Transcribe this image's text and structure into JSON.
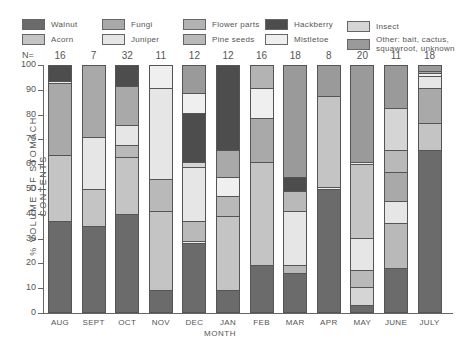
{
  "chart_data": {
    "type": "bar",
    "stacked": true,
    "title": "",
    "xlabel": "MONTH",
    "ylabel": "% VOLUME OF STOMACH CONTENTS",
    "ylim": [
      0,
      100
    ],
    "yticks": [
      0,
      10,
      20,
      30,
      40,
      50,
      60,
      70,
      80,
      90,
      100
    ],
    "grid": false,
    "legend_position": "top",
    "n_label": "N=",
    "categories": [
      "AUG",
      "SEPT",
      "OCT",
      "NOV",
      "DEC",
      "JAN",
      "FEB",
      "MAR",
      "APR",
      "MAY",
      "JUNE",
      "JULY"
    ],
    "n_values": [
      16,
      7,
      32,
      11,
      12,
      12,
      16,
      18,
      8,
      20,
      11,
      18
    ],
    "legend": [
      {
        "name": "Walnut",
        "color": "#6b6b6b"
      },
      {
        "name": "Acorn",
        "color": "#c4c4c4"
      },
      {
        "name": "Fungi",
        "color": "#a9a9a9"
      },
      {
        "name": "Juniper",
        "color": "#e6e6e6"
      },
      {
        "name": "Flower parts",
        "color": "#b3b3b3"
      },
      {
        "name": "Pine seeds",
        "color": "#b9b9b9"
      },
      {
        "name": "Hackberry",
        "color": "#4d4d4d"
      },
      {
        "name": "Mistletoe",
        "color": "#efefef"
      },
      {
        "name": "Insect",
        "color": "#d5d5d5"
      },
      {
        "name": "Other: bait, cactus, squawroot, unknown",
        "color": "#9a9a9a"
      }
    ],
    "bars": [
      {
        "month": "AUG",
        "segments": [
          {
            "cat": "Walnut",
            "value": 37
          },
          {
            "cat": "Acorn",
            "value": 27
          },
          {
            "cat": "Fungi",
            "value": 29
          },
          {
            "cat": "Mistletoe",
            "value": 1
          },
          {
            "cat": "Hackberry",
            "value": 6
          }
        ]
      },
      {
        "month": "SEPT",
        "segments": [
          {
            "cat": "Walnut",
            "value": 35
          },
          {
            "cat": "Acorn",
            "value": 15
          },
          {
            "cat": "Juniper",
            "value": 21
          },
          {
            "cat": "Fungi",
            "value": 29
          }
        ]
      },
      {
        "month": "OCT",
        "segments": [
          {
            "cat": "Walnut",
            "value": 40
          },
          {
            "cat": "Acorn",
            "value": 23
          },
          {
            "cat": "Pine seeds",
            "value": 5
          },
          {
            "cat": "Juniper",
            "value": 8
          },
          {
            "cat": "Fungi",
            "value": 16
          },
          {
            "cat": "Hackberry",
            "value": 8
          }
        ]
      },
      {
        "month": "NOV",
        "segments": [
          {
            "cat": "Walnut",
            "value": 9
          },
          {
            "cat": "Acorn",
            "value": 32
          },
          {
            "cat": "Pine seeds",
            "value": 13
          },
          {
            "cat": "Juniper",
            "value": 37
          },
          {
            "cat": "Mistletoe",
            "value": 9
          }
        ]
      },
      {
        "month": "DEC",
        "segments": [
          {
            "cat": "Walnut",
            "value": 28
          },
          {
            "cat": "Mistletoe",
            "value": 1
          },
          {
            "cat": "Pine seeds",
            "value": 8
          },
          {
            "cat": "Juniper",
            "value": 22
          },
          {
            "cat": "Insect",
            "value": 2
          },
          {
            "cat": "Hackberry",
            "value": 20
          },
          {
            "cat": "Mistletoe",
            "value": 8
          },
          {
            "cat": "Other: bait, cactus, squawroot, unknown",
            "value": 11
          }
        ]
      },
      {
        "month": "JAN",
        "segments": [
          {
            "cat": "Walnut",
            "value": 9
          },
          {
            "cat": "Acorn",
            "value": 30
          },
          {
            "cat": "Pine seeds",
            "value": 8
          },
          {
            "cat": "Mistletoe",
            "value": 8
          },
          {
            "cat": "Fungi",
            "value": 11
          },
          {
            "cat": "Hackberry",
            "value": 34
          }
        ]
      },
      {
        "month": "FEB",
        "segments": [
          {
            "cat": "Walnut",
            "value": 19
          },
          {
            "cat": "Acorn",
            "value": 42
          },
          {
            "cat": "Fungi",
            "value": 18
          },
          {
            "cat": "Mistletoe",
            "value": 12
          },
          {
            "cat": "Flower parts",
            "value": 9
          }
        ]
      },
      {
        "month": "MAR",
        "segments": [
          {
            "cat": "Walnut",
            "value": 16
          },
          {
            "cat": "Pine seeds",
            "value": 3
          },
          {
            "cat": "Juniper",
            "value": 22
          },
          {
            "cat": "Pine seeds",
            "value": 8
          },
          {
            "cat": "Hackberry",
            "value": 6
          },
          {
            "cat": "Other: bait, cactus, squawroot, unknown",
            "value": 45
          }
        ]
      },
      {
        "month": "APR",
        "segments": [
          {
            "cat": "Walnut",
            "value": 50
          },
          {
            "cat": "Mistletoe",
            "value": 1
          },
          {
            "cat": "Acorn",
            "value": 37
          },
          {
            "cat": "Other: bait, cactus, squawroot, unknown",
            "value": 12
          }
        ]
      },
      {
        "month": "MAY",
        "segments": [
          {
            "cat": "Walnut",
            "value": 3
          },
          {
            "cat": "Insect",
            "value": 7
          },
          {
            "cat": "Pine seeds",
            "value": 7
          },
          {
            "cat": "Juniper",
            "value": 13
          },
          {
            "cat": "Acorn",
            "value": 30
          },
          {
            "cat": "Mistletoe",
            "value": 1
          },
          {
            "cat": "Other: bait, cactus, squawroot, unknown",
            "value": 39
          }
        ]
      },
      {
        "month": "JUNE",
        "segments": [
          {
            "cat": "Walnut",
            "value": 18
          },
          {
            "cat": "Pine seeds",
            "value": 18
          },
          {
            "cat": "Juniper",
            "value": 9
          },
          {
            "cat": "Fungi",
            "value": 12
          },
          {
            "cat": "Pine seeds",
            "value": 9
          },
          {
            "cat": "Insect",
            "value": 17
          },
          {
            "cat": "Other: bait, cactus, squawroot, unknown",
            "value": 17
          }
        ]
      },
      {
        "month": "JULY",
        "segments": [
          {
            "cat": "Walnut",
            "value": 66
          },
          {
            "cat": "Acorn",
            "value": 11
          },
          {
            "cat": "Fungi",
            "value": 14
          },
          {
            "cat": "Juniper",
            "value": 5
          },
          {
            "cat": "Mistletoe",
            "value": 1
          },
          {
            "cat": "Fungi",
            "value": 1
          },
          {
            "cat": "Other: bait, cactus, squawroot, unknown",
            "value": 2
          }
        ]
      }
    ]
  },
  "legend_labels": {
    "walnut": "Walnut",
    "acorn": "Acorn",
    "fungi": "Fungi",
    "juniper": "Juniper",
    "flower_parts": "Flower parts",
    "pine_seeds": "Pine seeds",
    "hackberry": "Hackberry",
    "mistletoe": "Mistletoe",
    "insect": "Insect",
    "other": "Other: bait, cactus,\nsquawroot, unknown"
  }
}
